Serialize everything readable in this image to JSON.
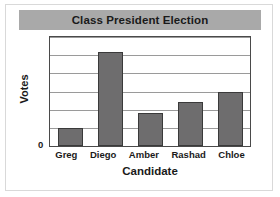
{
  "chart_data": {
    "type": "bar",
    "title": "Class President Election",
    "xlabel": "Candidate",
    "ylabel": "Votes",
    "categories": [
      "Greg",
      "Diego",
      "Amber",
      "Rashad",
      "Chloe"
    ],
    "values": [
      1,
      5.2,
      1.8,
      2.45,
      3
    ],
    "ylim": [
      0,
      6
    ],
    "ytick_labels": [
      "0"
    ],
    "grid": true,
    "gridlines": 6,
    "legend": "none",
    "bar_color": "#6e6d6e",
    "bar_edge_color": "#3a3a3a",
    "title_band_color": "#a9a9a9",
    "plot_border_color": "#4a4a4a",
    "gridline_color": "#9a9a9a",
    "background_color": "#ffffff"
  }
}
